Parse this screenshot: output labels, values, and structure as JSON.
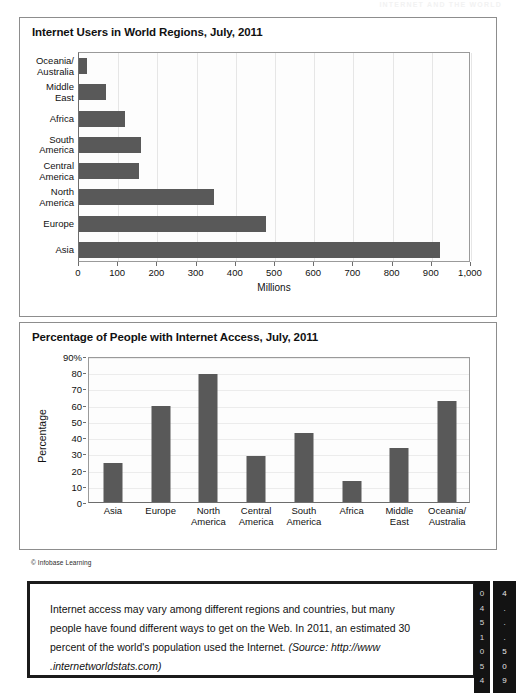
{
  "running_head": "INTERNET AND THE WORLD",
  "panel_top": {
    "title": "Internet Users in World Regions, July, 2011"
  },
  "panel_bottom": {
    "title": "Percentage of People with Internet Access, July, 2011"
  },
  "credit": "© Infobase Learning",
  "caption": {
    "body": "Internet access may vary among different regions and countries, but many people have found different ways to get on the Web. In 2011, an estimated 30 percent of the world's population used the Internet. ",
    "source": "(Source: http://www .internetworldstats.com)"
  },
  "edge_digits_left": [
    "0",
    "4",
    "5",
    "1",
    "0",
    "5",
    "4"
  ],
  "edge_digits_right": [
    "4",
    ".",
    ".",
    ".",
    "5",
    "0",
    "9"
  ],
  "chart_data": [
    {
      "type": "bar",
      "orientation": "horizontal",
      "title": "Internet Users in World Regions, July, 2011",
      "xlabel": "Millions",
      "ylabel": "",
      "xlim": [
        0,
        1000
      ],
      "xticks": [
        0,
        100,
        200,
        300,
        400,
        500,
        600,
        700,
        800,
        900,
        1000
      ],
      "xticklabels": [
        "0",
        "100",
        "200",
        "300",
        "400",
        "500",
        "600",
        "700",
        "800",
        "900",
        "1,000"
      ],
      "grid": true,
      "legend": "none",
      "bar_color": "#595959",
      "categories": [
        "Oceania/\nAustralia",
        "Middle\nEast",
        "Africa",
        "South\nAmerica",
        "Central\nAmerica",
        "North\nAmerica",
        "Europe",
        "Asia"
      ],
      "values": [
        21,
        68,
        118,
        158,
        152,
        344,
        476,
        922
      ]
    },
    {
      "type": "bar",
      "orientation": "vertical",
      "title": "Percentage of People with Internet Access, July, 2011",
      "xlabel": "",
      "ylabel": "Percentage",
      "ylim": [
        0,
        90
      ],
      "yticks": [
        0,
        10,
        20,
        30,
        40,
        50,
        60,
        70,
        80,
        90
      ],
      "yticklabels": [
        "0",
        "10",
        "20",
        "30",
        "40",
        "50",
        "60",
        "70",
        "80",
        "90%"
      ],
      "grid": true,
      "legend": "none",
      "bar_color": "#595959",
      "categories": [
        "Asia",
        "Europe",
        "North\nAmerica",
        "Central\nAmerica",
        "South\nAmerica",
        "Africa",
        "Middle\nEast",
        "Oceania/\nAustralia"
      ],
      "values": [
        24,
        59,
        79,
        28.5,
        42.5,
        13,
        33.5,
        62
      ]
    }
  ]
}
